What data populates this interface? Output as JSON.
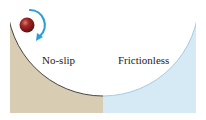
{
  "diagram": {
    "regions": [
      {
        "id": "no-slip",
        "label": "No-slip",
        "color": "#d8cdb2"
      },
      {
        "id": "frictionless",
        "label": "Frictionless",
        "color": "#d6eaf5"
      }
    ],
    "ball": {
      "color": "#8b1a1a",
      "highlight": "#d9605a"
    },
    "arrow": {
      "color": "#2a9fd6",
      "meaning": "rotation-arrow"
    },
    "bowl_outline_color": "#333333",
    "bowl_outline_right_color": "#9ec3dc"
  }
}
